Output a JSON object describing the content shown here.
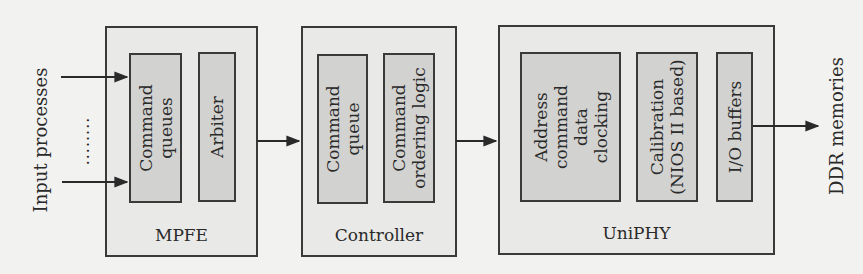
{
  "diagram": {
    "input_label": "Input processes",
    "ellipsis": "........",
    "output_label": "DDR memories",
    "blocks": [
      {
        "id": "mpfe",
        "label": "MPFE",
        "sub": [
          {
            "lines": [
              "Command",
              "queues"
            ]
          },
          {
            "lines": [
              "Arbiter"
            ]
          }
        ]
      },
      {
        "id": "controller",
        "label": "Controller",
        "sub": [
          {
            "lines": [
              "Command",
              "queue"
            ]
          },
          {
            "lines": [
              "Command",
              "ordering logic"
            ]
          }
        ]
      },
      {
        "id": "uniphy",
        "label": "UniPHY",
        "sub": [
          {
            "lines": [
              "Address",
              "command",
              "data",
              "clocking"
            ]
          },
          {
            "lines": [
              "Calibration",
              "(NIOS II based)"
            ]
          },
          {
            "lines": [
              "I/O buffers"
            ]
          }
        ]
      }
    ],
    "colors": {
      "background": "#f2f2f0",
      "outer_fill": "#e9e9e7",
      "inner_fill": "#d2d2d0",
      "stroke": "#3a3a3a"
    }
  }
}
